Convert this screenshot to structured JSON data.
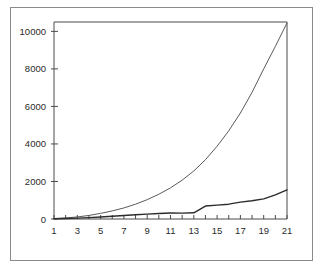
{
  "figure": {
    "background_color": "#ffffff",
    "frame_color": "#8a8a8a",
    "axis_color": "#4a4a4a",
    "plot_area": {
      "left_px": 54,
      "right_px": 287,
      "top_px": 22,
      "bottom_px": 219
    }
  },
  "chart_data": {
    "type": "line",
    "title": "",
    "subtitle": "",
    "xlabel": "",
    "ylabel": "",
    "xlim": [
      1,
      21
    ],
    "ylim": [
      0,
      10500
    ],
    "grid": false,
    "legend": null,
    "legend_position": "none",
    "x_tick_labels": [
      "1",
      "3",
      "5",
      "7",
      "9",
      "11",
      "13",
      "15",
      "17",
      "19",
      "21"
    ],
    "x_tick_values": [
      1,
      3,
      5,
      7,
      9,
      11,
      13,
      15,
      17,
      19,
      21
    ],
    "x_minor_tick_values": [
      1,
      2,
      3,
      4,
      5,
      6,
      7,
      8,
      9,
      10,
      11,
      12,
      13,
      14,
      15,
      16,
      17,
      18,
      19,
      20,
      21
    ],
    "y_tick_labels": [
      "0",
      "2000",
      "4000",
      "6000",
      "8000",
      "10000"
    ],
    "y_tick_values": [
      0,
      2000,
      4000,
      6000,
      8000,
      10000
    ],
    "x": [
      1,
      2,
      3,
      4,
      5,
      6,
      7,
      8,
      9,
      10,
      11,
      12,
      13,
      14,
      15,
      16,
      17,
      18,
      19,
      20,
      21
    ],
    "series": [
      {
        "name": "upper-curve",
        "color": "#5a5a5a",
        "width": 1,
        "values": [
          20,
          55,
          110,
          190,
          300,
          430,
          590,
          790,
          1030,
          1320,
          1660,
          2070,
          2560,
          3160,
          3880,
          4700,
          5650,
          6750,
          8000,
          9200,
          10450
        ]
      },
      {
        "name": "lower-curve",
        "color": "#2b2b2b",
        "width": 1.4,
        "values": [
          10,
          25,
          45,
          75,
          110,
          150,
          190,
          225,
          260,
          290,
          320,
          315,
          330,
          690,
          740,
          790,
          900,
          970,
          1070,
          1290,
          1550
        ]
      }
    ]
  }
}
